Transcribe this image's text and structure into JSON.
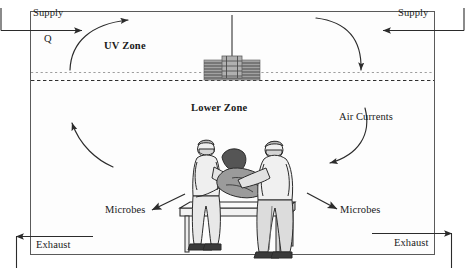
{
  "diagram": {
    "background_color": "#ffffff",
    "line_color": "#333333",
    "room_fill": "#fdfdfd"
  },
  "room": {
    "border_color": "#555555",
    "divider_label": "dashed-zone-divider"
  },
  "labels": {
    "supply_left": "Supply",
    "flow_rate": "Q",
    "supply_right": "Supply",
    "uv_zone": "UV Zone",
    "lower_zone": "Lower Zone",
    "air_currents": "Air Currents",
    "microbes_left": "Microbes",
    "microbes_right": "Microbes",
    "exhaust_left": "Exhaust",
    "exhaust_right": "Exhaust"
  },
  "fixture": {
    "name": "uv-louvered-fixture",
    "body_color": "#9a9a9a",
    "louver_color": "#4a4a4a",
    "rod_color": "#8e8e8e"
  },
  "scene": {
    "name": "operating-table-scene",
    "figures": [
      "surgeon-left",
      "patient",
      "surgeon-right"
    ],
    "table": "operating-table",
    "skin_color": "#c9c9c9",
    "gown_color": "#ededed",
    "shade_color": "#b4b4b4"
  }
}
